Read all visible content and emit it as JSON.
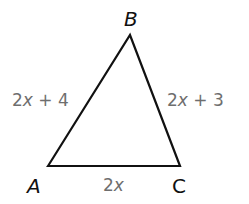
{
  "figure": {
    "type": "triangle",
    "stroke_color": "#111111",
    "label_color": "#6e6e6e",
    "vertices": [
      {
        "name": "A",
        "x": 48,
        "y": 166
      },
      {
        "name": "B",
        "x": 130,
        "y": 35
      },
      {
        "name": "C",
        "x": 180,
        "y": 166
      }
    ],
    "sides": {
      "AB": {
        "coef": "2",
        "var": "x",
        "rest": " + 4"
      },
      "BC": {
        "coef": "2",
        "var": "x",
        "rest": " + 3"
      },
      "AC": {
        "coef": "2",
        "var": "x",
        "rest": ""
      }
    }
  }
}
